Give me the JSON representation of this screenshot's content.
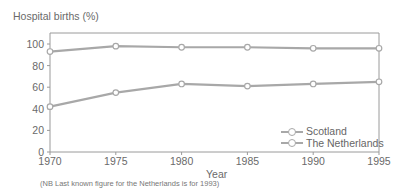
{
  "chart_data": {
    "type": "line",
    "title": "",
    "ylabel": "Hospital births (%)",
    "xlabel": "Year",
    "x": [
      1970,
      1975,
      1980,
      1985,
      1990,
      1995
    ],
    "series": [
      {
        "name": "Scotland",
        "values": [
          93,
          98,
          97,
          97,
          96,
          96
        ]
      },
      {
        "name": "The Netherlands",
        "values": [
          42,
          55,
          63,
          61,
          63,
          65
        ]
      }
    ],
    "ylim": [
      0,
      100
    ],
    "xlim": [
      1970,
      1995
    ],
    "yticks": [
      0,
      20,
      40,
      60,
      80,
      100
    ],
    "xticks": [
      1970,
      1975,
      1980,
      1985,
      1990,
      1995
    ],
    "grid": false,
    "legend_position": "lower right",
    "annotation": "(NB Last known figure for the Netherlands is for 1993)"
  },
  "labels": {
    "y_title": "Hospital births (%)",
    "x_title": "Year",
    "note": "(NB Last known figure for the Netherlands is for 1993)",
    "legend": [
      "Scotland",
      "The Netherlands"
    ],
    "yticks": [
      "0",
      "20",
      "40",
      "60",
      "80",
      "100"
    ],
    "xticks": [
      "1970",
      "1975",
      "1980",
      "1985",
      "1990",
      "1995"
    ]
  },
  "colors": {
    "line": "#a8a8a8",
    "axis": "#9a9a9a",
    "text": "#6a6a6a"
  }
}
